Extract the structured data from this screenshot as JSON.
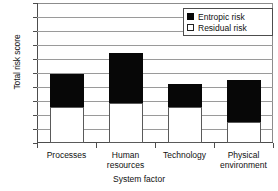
{
  "chart_data": {
    "type": "bar",
    "subtype": "stacked-bar",
    "title": "",
    "xlabel": "System factor",
    "ylabel": "Total risk score",
    "categories": [
      "Processes",
      "Human resources",
      "Technology",
      "Physical environment"
    ],
    "category_lines": [
      [
        "Processes"
      ],
      [
        "Human",
        "resources"
      ],
      [
        "Technology"
      ],
      [
        "Physical",
        "environment"
      ]
    ],
    "series": [
      {
        "name": "Residual risk",
        "values": [
          5.1,
          5.7,
          5.1,
          3.0
        ],
        "color": "#ffffff"
      },
      {
        "name": "Entropic risk",
        "values": [
          4.7,
          7.1,
          3.4,
          6.0
        ],
        "color": "#070707"
      }
    ],
    "totals": [
      9.8,
      12.8,
      8.5,
      9.0
    ],
    "ylim": [
      0,
      20
    ],
    "ytick_step": 2,
    "yticks": [
      0,
      2,
      4,
      6,
      8,
      10,
      12,
      14,
      16,
      18,
      20
    ],
    "ytick_labels": [
      "0",
      "2",
      "4",
      "6",
      "8",
      "10",
      "12",
      "14",
      "16",
      "18",
      "20"
    ],
    "grid": true,
    "legend_position": "top-right",
    "legend": [
      {
        "label": "Entropic risk",
        "swatch": "filled"
      },
      {
        "label": "Residual risk",
        "swatch": "hollow"
      }
    ]
  }
}
